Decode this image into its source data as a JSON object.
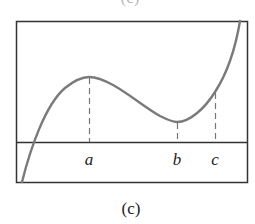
{
  "figure": {
    "top_caption_partial": "(c)",
    "caption": "(c)",
    "points": [
      {
        "label": "a",
        "desc": "local maximum"
      },
      {
        "label": "b",
        "desc": "local minimum"
      },
      {
        "label": "c",
        "desc": "point on increasing branch"
      }
    ],
    "colors": {
      "curve": "#7a7a7a",
      "frame": "#333333",
      "dash": "#777777"
    }
  }
}
